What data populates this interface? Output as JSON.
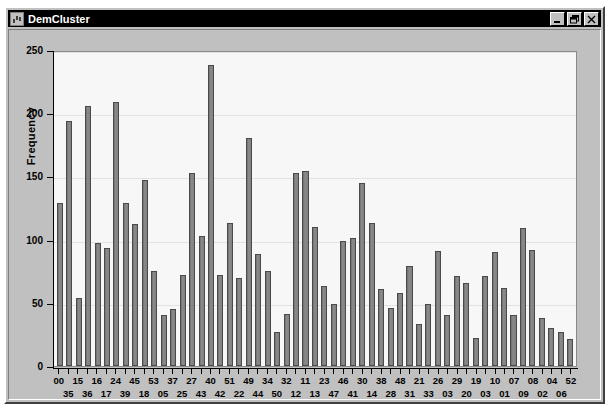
{
  "window": {
    "title": "DemCluster",
    "icon": "window-menu-icon",
    "buttons": [
      {
        "name": "minimize-button",
        "label": "Minimize",
        "glyph": "minimize"
      },
      {
        "name": "restore-button",
        "label": "Restore",
        "glyph": "restore"
      },
      {
        "name": "close-button",
        "label": "Close",
        "glyph": "close"
      }
    ]
  },
  "chart_data": {
    "type": "bar",
    "title": "",
    "xlabel": "Demographic Cluster",
    "ylabel": "Frequency",
    "ylim": [
      0,
      250
    ],
    "yticks": [
      0,
      50,
      100,
      150,
      200,
      250
    ],
    "grid": true,
    "legend": false,
    "bar_color": "#808080",
    "bar_edge_color": "#4a4a4a",
    "plot_background": "#f7f7f7",
    "categories": [
      "00",
      "35",
      "15",
      "36",
      "16",
      "17",
      "24",
      "39",
      "45",
      "18",
      "53",
      "05",
      "37",
      "25",
      "27",
      "43",
      "40",
      "42",
      "51",
      "22",
      "49",
      "44",
      "34",
      "50",
      "32",
      "12",
      "11",
      "13",
      "23",
      "47",
      "46",
      "41",
      "30",
      "14",
      "38",
      "28",
      "48",
      "31",
      "21",
      "33",
      "26",
      "03",
      "29",
      "20",
      "19",
      "03",
      "10",
      "01",
      "07",
      "09",
      "08",
      "02",
      "04",
      "06",
      "52"
    ],
    "values": [
      129,
      194,
      54,
      206,
      97,
      93,
      209,
      129,
      112,
      147,
      75,
      40,
      45,
      72,
      153,
      103,
      238,
      72,
      113,
      70,
      180,
      89,
      75,
      27,
      41,
      153,
      154,
      110,
      63,
      49,
      99,
      101,
      145,
      113,
      61,
      46,
      58,
      79,
      33,
      49,
      91,
      40,
      71,
      66,
      22,
      71,
      90,
      62,
      40,
      109,
      92,
      38,
      30,
      27,
      21
    ]
  }
}
